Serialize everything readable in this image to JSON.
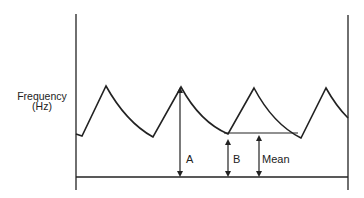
{
  "diagram": {
    "y_axis_label_line1": "Frequency",
    "y_axis_label_line2": "(Hz)",
    "labels": {
      "a": "A",
      "b": "B",
      "mean": "Mean"
    },
    "colors": {
      "line": "#222222",
      "background": "#ffffff"
    },
    "waveform_points": [
      [
        76,
        134
      ],
      [
        82,
        136
      ],
      [
        106,
        86
      ],
      [
        153,
        137
      ],
      [
        181,
        87
      ],
      [
        228,
        134
      ],
      [
        254,
        88
      ],
      [
        301,
        138
      ],
      [
        326,
        88
      ],
      [
        348,
        118
      ]
    ],
    "mean_line": {
      "x1": 224,
      "x2": 298,
      "y": 133
    }
  }
}
